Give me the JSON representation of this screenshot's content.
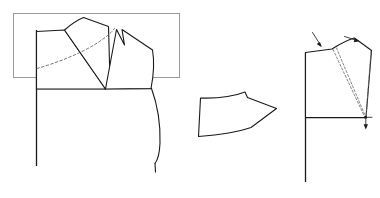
{
  "diagram": {
    "title": "Bodice dart manipulation pattern draft",
    "background_color": "#ffffff",
    "line_color": "#1a1a1a",
    "frame_color": "#9a9a9a",
    "dashed_color": "#5d5d5d",
    "width": 380,
    "height": 198,
    "figure_count": 3
  },
  "figures": {
    "left": {
      "name": "bodice-front-with-rotated-dart",
      "label": "",
      "frame": {
        "name": "highlight-frame",
        "x": 13,
        "y": 13,
        "width": 167,
        "height": 65,
        "stroke": "#9a9a9a"
      },
      "elements": [
        {
          "name": "center-front-vertical-line",
          "type": "line"
        },
        {
          "name": "waist-horizontal-line",
          "type": "line"
        },
        {
          "name": "main-bodice-outline",
          "type": "path"
        },
        {
          "name": "rotated-shoulder-panel",
          "type": "path"
        },
        {
          "name": "dart-legs",
          "type": "path"
        },
        {
          "name": "armhole-curve",
          "type": "path"
        },
        {
          "name": "side-seam-curve",
          "type": "path"
        },
        {
          "name": "original-dart-guideline",
          "type": "dashed-path"
        }
      ]
    },
    "middle": {
      "name": "cut-away-dart-wedge",
      "label": "",
      "elements": [
        {
          "name": "wedge-outline",
          "type": "path"
        }
      ]
    },
    "right": {
      "name": "bodice-front-dart-rotation",
      "label": "",
      "elements": [
        {
          "name": "center-front-vertical-line",
          "type": "line"
        },
        {
          "name": "waist-horizontal-line",
          "type": "line"
        },
        {
          "name": "bodice-outline",
          "type": "path"
        },
        {
          "name": "dart-pivot-point",
          "type": "point"
        },
        {
          "name": "rotation-guideline-left",
          "type": "dashed-path"
        },
        {
          "name": "rotation-guideline-right",
          "type": "dashed-path"
        },
        {
          "name": "shoulder-arrow-down",
          "type": "arrow"
        },
        {
          "name": "shoulder-arrow-right",
          "type": "arrow"
        },
        {
          "name": "pivot-arrow-down",
          "type": "arrow"
        }
      ]
    }
  }
}
